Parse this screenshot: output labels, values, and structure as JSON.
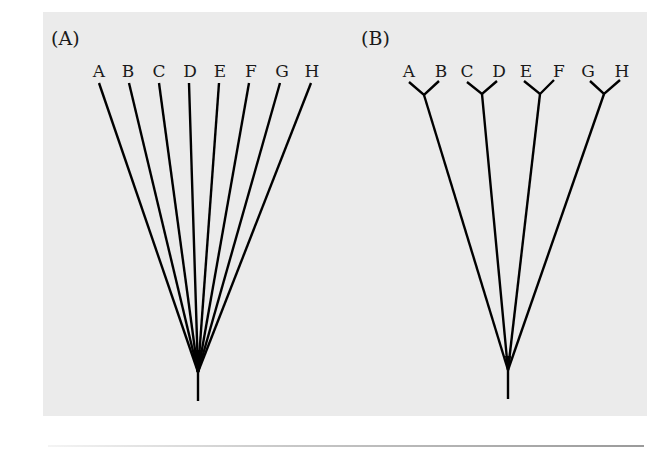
{
  "figure": {
    "background_color": "#ebebeb",
    "line_color": "#000000",
    "panels": [
      {
        "id": "A",
        "label": "(A)",
        "description": "Polytomy: all taxa diverge from a single node",
        "taxa": [
          "A",
          "B",
          "C",
          "D",
          "E",
          "F",
          "G",
          "H"
        ],
        "root": {
          "x": 198,
          "y": 372,
          "stem_end_y": 401
        }
      },
      {
        "id": "B",
        "label": "(B)",
        "description": "Four sister pairs (A,B), (C,D), (E,F), (G,H) diverging from a single node",
        "taxa": [
          "A",
          "B",
          "C",
          "D",
          "E",
          "F",
          "G",
          "H"
        ],
        "pairs": [
          [
            "A",
            "B"
          ],
          [
            "C",
            "D"
          ],
          [
            "E",
            "F"
          ],
          [
            "G",
            "H"
          ]
        ],
        "root": {
          "x": 508,
          "y": 370,
          "stem_end_y": 399
        }
      }
    ]
  }
}
